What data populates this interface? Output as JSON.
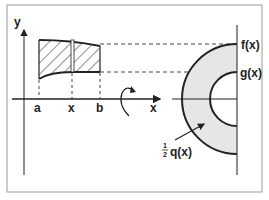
{
  "diagram": {
    "colors": {
      "stroke": "#222222",
      "shade": "#e6e6e6",
      "frame": "#9a9a9a",
      "dash": "#444444"
    },
    "labels": {
      "y_axis": "y",
      "x_axis": "x",
      "a": "a",
      "x": "x",
      "b": "b",
      "f": "f(x)",
      "g": "g(x)",
      "half": "1",
      "half_den": "2",
      "q": "q(x)"
    },
    "icons": {
      "rotation": "rotation-arrow-icon"
    }
  }
}
